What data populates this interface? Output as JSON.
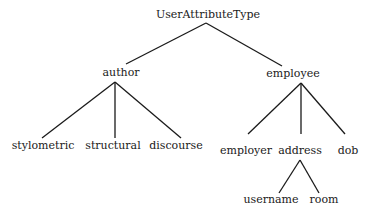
{
  "diagram": {
    "type": "tree",
    "root": "UserAttributeType",
    "nodes": [
      {
        "id": "root",
        "label": "UserAttributeType",
        "x": 207,
        "y": 9
      },
      {
        "id": "author",
        "label": "author",
        "x": 120,
        "y": 66
      },
      {
        "id": "employee",
        "label": "employee",
        "x": 300,
        "y": 67
      },
      {
        "id": "stylometric",
        "label": "stylometric",
        "x": 42,
        "y": 39
      },
      {
        "id": "structural",
        "label": "structural",
        "x": 112,
        "y": 39
      },
      {
        "id": "discourse",
        "label": "discourse",
        "x": 176,
        "y": 39
      },
      {
        "id": "employer",
        "label": "employer",
        "x": 246,
        "y": 44
      },
      {
        "id": "address",
        "label": "address",
        "x": 300,
        "y": 44
      },
      {
        "id": "dob",
        "label": "dob",
        "x": 347,
        "y": 44
      },
      {
        "id": "username",
        "label": "username",
        "x": 271,
        "y": 93
      },
      {
        "id": "room",
        "label": "room",
        "x": 324,
        "y": 93
      }
    ],
    "edges": [
      {
        "from": "UserAttributeType",
        "to": "author",
        "x1": 206,
        "y1": 23,
        "x2": 126,
        "y2": 64
      },
      {
        "from": "UserAttributeType",
        "to": "employee",
        "x1": 206,
        "y1": 23,
        "x2": 282,
        "y2": 66
      },
      {
        "from": "author",
        "to": "stylometric",
        "x1": 115,
        "y1": 82,
        "x2": 42,
        "y2": 138
      },
      {
        "from": "author",
        "to": "structural",
        "x1": 115,
        "y1": 82,
        "x2": 115,
        "y2": 138
      },
      {
        "from": "author",
        "to": "discourse",
        "x1": 115,
        "y1": 82,
        "x2": 181,
        "y2": 138
      },
      {
        "from": "employee",
        "to": "employer",
        "x1": 301,
        "y1": 83,
        "x2": 248,
        "y2": 134
      },
      {
        "from": "employee",
        "to": "address",
        "x1": 301,
        "y1": 83,
        "x2": 301,
        "y2": 134
      },
      {
        "from": "employee",
        "to": "dob",
        "x1": 301,
        "y1": 83,
        "x2": 345,
        "y2": 134
      },
      {
        "from": "address",
        "to": "username",
        "x1": 300,
        "y1": 160,
        "x2": 279,
        "y2": 193
      },
      {
        "from": "address",
        "to": "room",
        "x1": 300,
        "y1": 160,
        "x2": 319,
        "y2": 193
      }
    ]
  },
  "labels": {
    "root": "UserAttributeType",
    "author": "author",
    "employee": "employee",
    "stylometric": "stylometric",
    "structural": "structural",
    "discourse": "discourse",
    "employer": "employer",
    "address": "address",
    "dob": "dob",
    "username": "username",
    "room": "room"
  }
}
